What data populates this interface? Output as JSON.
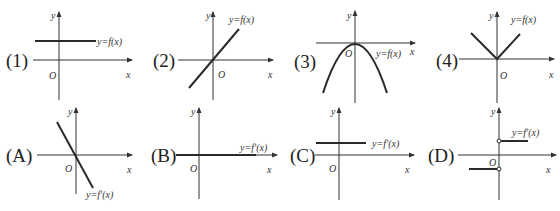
{
  "figure": {
    "top_row": [
      {
        "label": "(1)",
        "function_label": "y=f(x)",
        "axis_y": "y",
        "axis_x": "x",
        "origin": "O",
        "shape": "horizontal line above x-axis"
      },
      {
        "label": "(2)",
        "function_label": "y=f(x)",
        "axis_y": "y",
        "axis_x": "x",
        "origin": "O",
        "shape": "line through origin, positive slope"
      },
      {
        "label": "(3)",
        "function_label": "y=f(x)",
        "axis_y": "y",
        "axis_x": "x",
        "origin": "O",
        "shape": "downward parabola, vertex at origin"
      },
      {
        "label": "(4)",
        "function_label": "y=f(x)",
        "axis_y": "y",
        "axis_x": "x",
        "origin": "O",
        "shape": "absolute value V at origin"
      }
    ],
    "bottom_row": [
      {
        "label": "(A)",
        "function_label": "y=f′(x)",
        "axis_y": "y",
        "axis_x": "x",
        "origin": "O",
        "shape": "line through origin, negative slope"
      },
      {
        "label": "(B)",
        "function_label": "y=f′(x)",
        "axis_y": "y",
        "axis_x": "x",
        "origin": "O",
        "shape": "zero line along x-axis"
      },
      {
        "label": "(C)",
        "function_label": "y=f′(x)",
        "axis_y": "y",
        "axis_x": "x",
        "origin": "O",
        "shape": "horizontal line above x-axis"
      },
      {
        "label": "(D)",
        "function_label": "y=f′(x)",
        "axis_y": "y",
        "axis_x": "x",
        "origin": "O",
        "shape": "step function with open circles at x=0"
      }
    ]
  },
  "colors": {
    "line": "#2a2a2a",
    "axis": "#333333",
    "background": "#ffffff"
  }
}
